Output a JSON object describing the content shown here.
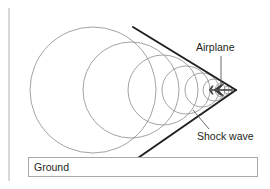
{
  "figure": {
    "title": "",
    "labels": {
      "airplane": "Airplane",
      "shock_wave": "Shock wave",
      "ground": "Ground"
    },
    "colors": {
      "wavefront_stroke": "#8c8c8c",
      "shock_line_stroke": "#231f20",
      "leader_stroke": "#58595b",
      "ground_box_border": "#a7a9ac",
      "rule_line": "#bcbec0",
      "text": "#231f20",
      "airplane_body": "#3a3a3a",
      "background": "#ffffff"
    },
    "geometry": {
      "apex": {
        "x": 236,
        "y": 90
      },
      "shock_upper_end": {
        "x": 133,
        "y": 27
      },
      "shock_lower_end": {
        "x": 135,
        "y": 160
      },
      "wavefronts": [
        {
          "cx": 93,
          "cy": 90,
          "r": 63
        },
        {
          "cx": 131,
          "cy": 90,
          "r": 48
        },
        {
          "cx": 163,
          "cy": 90,
          "r": 35
        },
        {
          "cx": 186,
          "cy": 90,
          "r": 24
        },
        {
          "cx": 202,
          "cy": 90,
          "r": 17
        },
        {
          "cx": 214,
          "cy": 90,
          "r": 11
        },
        {
          "cx": 222,
          "cy": 90,
          "r": 7
        },
        {
          "cx": 228,
          "cy": 90,
          "r": 4
        }
      ],
      "ground_box": {
        "x": 28,
        "y": 157,
        "width": 230,
        "height": 20
      },
      "left_rule": {
        "x": 9,
        "y1": 8,
        "y2": 181
      },
      "airplane_leader": {
        "x1": 221,
        "y1": 56,
        "x2": 221,
        "y2": 85
      },
      "shockwave_leader": {
        "x1": 209,
        "y1": 129,
        "x2": 193,
        "y2": 110
      },
      "airplane_icon": {
        "x": 209,
        "y": 84,
        "width": 26,
        "height": 11
      }
    }
  }
}
